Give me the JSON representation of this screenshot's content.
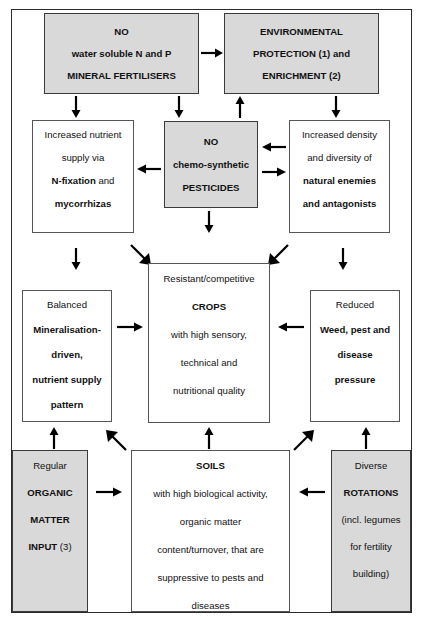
{
  "diagram": {
    "colors": {
      "shaded_box_fill": "#d9d9d9",
      "plain_box_fill": "#ffffff",
      "border": "#555555",
      "frame": "#2b2b2b",
      "text": "#111111",
      "arrow": "#000000"
    },
    "boxes": {
      "no_mineral_fertilisers": {
        "shaded": true,
        "lines": [
          {
            "text": "NO",
            "bold": true
          },
          {
            "text": "water soluble N and P",
            "bold": true
          },
          {
            "text": "MINERAL FERTILISERS",
            "bold": true
          }
        ]
      },
      "environmental_protection": {
        "shaded": true,
        "lines": [
          {
            "text": "ENVIRONMENTAL",
            "bold": true
          },
          {
            "text": "PROTECTION (1) and",
            "bold": true
          },
          {
            "text": "ENRICHMENT (2)",
            "bold": true
          }
        ]
      },
      "increased_nutrient_supply": {
        "shaded": false,
        "lines": [
          {
            "text": "Increased nutrient",
            "bold": false
          },
          {
            "text": "supply via",
            "bold": false
          },
          {
            "text": "N-fixation and",
            "bold": "mixed",
            "bold_part": "N-fixation",
            "plain_part": " and"
          },
          {
            "text": "mycorrhizas",
            "bold": true
          }
        ]
      },
      "no_pesticides": {
        "shaded": true,
        "lines": [
          {
            "text": "NO",
            "bold": true
          },
          {
            "text": "chemo-synthetic",
            "bold": true
          },
          {
            "text": "PESTICIDES",
            "bold": true
          }
        ]
      },
      "increased_density_diversity": {
        "shaded": false,
        "lines": [
          {
            "text": "Increased density",
            "bold": false
          },
          {
            "text": "and diversity of",
            "bold": false
          },
          {
            "text": "natural enemies",
            "bold": true
          },
          {
            "text": "and antagonists",
            "bold": true
          }
        ]
      },
      "balanced_mineralisation": {
        "shaded": false,
        "lines": [
          {
            "text": "Balanced",
            "bold": false
          },
          {
            "text": "Mineralisation-",
            "bold": true
          },
          {
            "text": "driven,",
            "bold": true
          },
          {
            "text": "nutrient supply",
            "bold": true
          },
          {
            "text": "pattern",
            "bold": true
          }
        ]
      },
      "resistant_crops": {
        "shaded": false,
        "lines": [
          {
            "text": "Resistant/competitive",
            "bold": false
          },
          {
            "text": "CROPS",
            "bold": true
          },
          {
            "text": "with high sensory,",
            "bold": false
          },
          {
            "text": "technical and",
            "bold": false
          },
          {
            "text": "nutritional quality",
            "bold": false
          }
        ]
      },
      "reduced_pressure": {
        "shaded": false,
        "lines": [
          {
            "text": "Reduced",
            "bold": false
          },
          {
            "text": "Weed, pest and",
            "bold": true
          },
          {
            "text": "disease",
            "bold": true
          },
          {
            "text": "pressure",
            "bold": true
          }
        ]
      },
      "organic_matter_input": {
        "shaded": true,
        "lines": [
          {
            "text": "Regular",
            "bold": false
          },
          {
            "text": "ORGANIC",
            "bold": true
          },
          {
            "text": "MATTER",
            "bold": true
          },
          {
            "text": "INPUT (3)",
            "bold": "mixed",
            "bold_part": "INPUT",
            "plain_part": " (3)"
          }
        ]
      },
      "soils": {
        "shaded": false,
        "lines": [
          {
            "text": "SOILS",
            "bold": true
          },
          {
            "text": "with high biological activity,",
            "bold": false
          },
          {
            "text": "organic matter",
            "bold": false
          },
          {
            "text": "content/turnover, that are",
            "bold": false
          },
          {
            "text": "suppressive to pests and",
            "bold": false
          },
          {
            "text": "diseases",
            "bold": false
          }
        ]
      },
      "diverse_rotations": {
        "shaded": true,
        "lines": [
          {
            "text": "Diverse",
            "bold": false
          },
          {
            "text": "ROTATIONS",
            "bold": true
          },
          {
            "text": "(incl. legumes",
            "bold": false
          },
          {
            "text": "for fertility",
            "bold": false
          },
          {
            "text": "building)",
            "bold": false
          }
        ]
      }
    },
    "arrows": [
      {
        "name": "fertilisers-to-environmental",
        "direction": "right"
      },
      {
        "name": "fertilisers-down-left",
        "direction": "down"
      },
      {
        "name": "fertilisers-down-right",
        "direction": "down"
      },
      {
        "name": "pesticides-up-to-environmental",
        "direction": "up"
      },
      {
        "name": "environmental-down-to-enemies",
        "direction": "down"
      },
      {
        "name": "pesticides-to-nutrient-supply",
        "direction": "left"
      },
      {
        "name": "enemies-to-pesticides",
        "direction": "left"
      },
      {
        "name": "pesticides-to-enemies",
        "direction": "right"
      },
      {
        "name": "pesticides-down-to-crops",
        "direction": "down"
      },
      {
        "name": "nutrient-supply-down-to-mineralisation",
        "direction": "down"
      },
      {
        "name": "nutrient-supply-diag-to-crops",
        "direction": "down-right"
      },
      {
        "name": "enemies-diag-to-crops",
        "direction": "down-left"
      },
      {
        "name": "enemies-down-to-reduced",
        "direction": "down"
      },
      {
        "name": "mineralisation-to-crops",
        "direction": "right"
      },
      {
        "name": "reduced-to-crops",
        "direction": "left"
      },
      {
        "name": "organic-matter-up-to-mineralisation",
        "direction": "up"
      },
      {
        "name": "soils-diag-to-mineralisation",
        "direction": "up-left"
      },
      {
        "name": "soils-up-to-crops",
        "direction": "up"
      },
      {
        "name": "soils-diag-to-reduced",
        "direction": "up-right"
      },
      {
        "name": "rotations-up-to-reduced",
        "direction": "up"
      },
      {
        "name": "organic-matter-to-soils",
        "direction": "right"
      },
      {
        "name": "rotations-to-soils",
        "direction": "left"
      }
    ]
  }
}
